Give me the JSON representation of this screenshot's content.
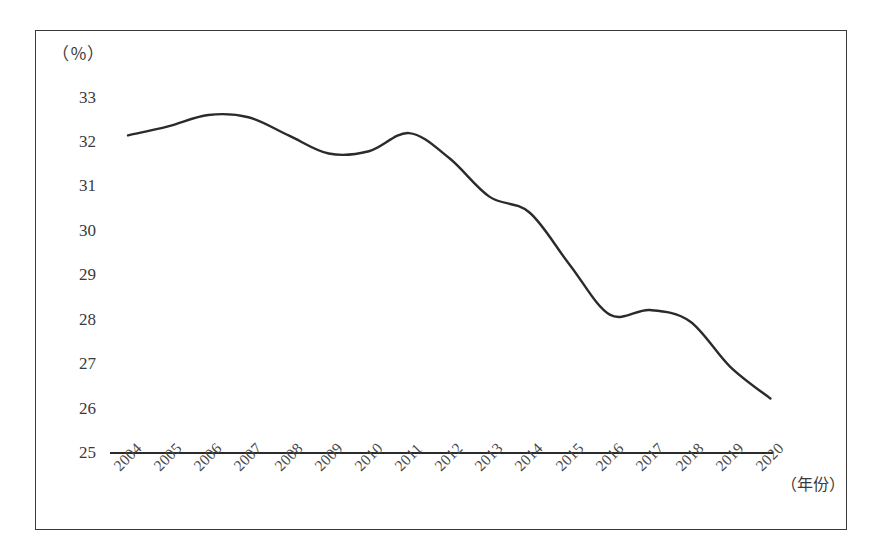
{
  "chart_data": {
    "type": "line",
    "title": "",
    "subtitle": "",
    "xlabel": "（年份）",
    "ylabel": "（％）",
    "y_unit_caption": "（％）",
    "x_unit_caption": "（年份）",
    "categories": [
      "2004",
      "2005",
      "2006",
      "2007",
      "2008",
      "2009",
      "2010",
      "2011",
      "2012",
      "2013",
      "2014",
      "2015",
      "2016",
      "2017",
      "2018",
      "2019",
      "2020"
    ],
    "values": [
      32.0,
      32.2,
      32.45,
      32.4,
      32.0,
      31.6,
      31.65,
      32.05,
      31.5,
      30.65,
      30.3,
      29.15,
      28.05,
      28.15,
      27.9,
      26.9,
      26.2
    ],
    "series": [
      {
        "name": "比重",
        "values": [
          32.0,
          32.2,
          32.45,
          32.4,
          32.0,
          31.6,
          31.65,
          32.05,
          31.5,
          30.65,
          30.3,
          29.15,
          28.05,
          28.15,
          27.9,
          26.9,
          26.2
        ]
      }
    ],
    "ylim": [
      25,
      33
    ],
    "xlim": [
      "2004",
      "2020"
    ],
    "y_ticks": [
      33,
      32,
      31,
      30,
      29,
      28,
      27,
      26,
      25
    ],
    "x_ticks": [
      "2004",
      "2005",
      "2006",
      "2007",
      "2008",
      "2009",
      "2010",
      "2011",
      "2012",
      "2013",
      "2014",
      "2015",
      "2016",
      "2017",
      "2018",
      "2019",
      "2020"
    ],
    "grid": false,
    "legend": null,
    "legend_position": "none",
    "line_color": "#2b2b2b",
    "line_width": 2.4,
    "markers": false,
    "smoothing": "spline",
    "annotations": []
  },
  "figure": {
    "border_color": "#3b3b3b",
    "background": "#ffffff",
    "axis_color": "#2b2b2b",
    "tick_label_color": "#3a3a3a",
    "x_label_rotation_degrees": -45
  }
}
